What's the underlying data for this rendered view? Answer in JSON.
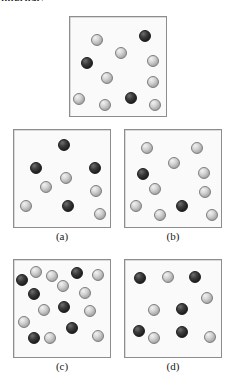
{
  "document": {
    "clipped_heading": "internal?",
    "background_color": "#ffffff"
  },
  "legend": {
    "light_sphere_color": "#c9c9c9",
    "dark_sphere_color": "#2b2b2b",
    "panel_fill_color": "#fafafa",
    "panel_border_color": "#8d8d8d"
  },
  "panels": [
    {
      "id": "reference",
      "label": "",
      "box": {
        "x": 69,
        "y": 16,
        "w": 98,
        "h": 101
      },
      "counts": {
        "light": 9,
        "dark": 3,
        "total": 12
      },
      "spheres": [
        {
          "x": 21,
          "y": 17,
          "type": "light"
        },
        {
          "x": 69,
          "y": 13,
          "type": "dark"
        },
        {
          "x": 45,
          "y": 30,
          "type": "light"
        },
        {
          "x": 11,
          "y": 40,
          "type": "dark"
        },
        {
          "x": 77,
          "y": 38,
          "type": "light"
        },
        {
          "x": 31,
          "y": 55,
          "type": "light"
        },
        {
          "x": 77,
          "y": 59,
          "type": "light"
        },
        {
          "x": 3,
          "y": 76,
          "type": "light"
        },
        {
          "x": 55,
          "y": 75,
          "type": "dark"
        },
        {
          "x": 29,
          "y": 82,
          "type": "light"
        },
        {
          "x": 79,
          "y": 82,
          "type": "light"
        }
      ]
    },
    {
      "id": "a",
      "label": "(a)",
      "box": {
        "x": 13,
        "y": 129,
        "w": 98,
        "h": 99
      },
      "counts": {
        "light": 6,
        "dark": 4,
        "total": 10
      },
      "spheres": [
        {
          "x": 44,
          "y": 9,
          "type": "dark"
        },
        {
          "x": 16,
          "y": 32,
          "type": "dark"
        },
        {
          "x": 75,
          "y": 32,
          "type": "dark"
        },
        {
          "x": 46,
          "y": 42,
          "type": "light"
        },
        {
          "x": 26,
          "y": 51,
          "type": "light"
        },
        {
          "x": 76,
          "y": 55,
          "type": "light"
        },
        {
          "x": 6,
          "y": 70,
          "type": "light"
        },
        {
          "x": 48,
          "y": 70,
          "type": "dark"
        },
        {
          "x": 80,
          "y": 78,
          "type": "light"
        }
      ]
    },
    {
      "id": "b",
      "label": "(b)",
      "box": {
        "x": 124,
        "y": 129,
        "w": 98,
        "h": 99
      },
      "counts": {
        "light": 9,
        "dark": 2,
        "total": 11
      },
      "spheres": [
        {
          "x": 16,
          "y": 12,
          "type": "light"
        },
        {
          "x": 66,
          "y": 12,
          "type": "light"
        },
        {
          "x": 43,
          "y": 27,
          "type": "light"
        },
        {
          "x": 12,
          "y": 38,
          "type": "dark"
        },
        {
          "x": 73,
          "y": 37,
          "type": "light"
        },
        {
          "x": 24,
          "y": 53,
          "type": "light"
        },
        {
          "x": 74,
          "y": 56,
          "type": "light"
        },
        {
          "x": 5,
          "y": 70,
          "type": "light"
        },
        {
          "x": 51,
          "y": 70,
          "type": "dark"
        },
        {
          "x": 29,
          "y": 79,
          "type": "light"
        },
        {
          "x": 81,
          "y": 79,
          "type": "light"
        }
      ]
    },
    {
      "id": "c",
      "label": "(c)",
      "box": {
        "x": 13,
        "y": 259,
        "w": 98,
        "h": 99
      },
      "counts": {
        "light": 10,
        "dark": 8,
        "total": 18
      },
      "spheres": [
        {
          "x": 16,
          "y": 6,
          "type": "light"
        },
        {
          "x": 32,
          "y": 10,
          "type": "light"
        },
        {
          "x": 57,
          "y": 7,
          "type": "dark"
        },
        {
          "x": 78,
          "y": 9,
          "type": "light"
        },
        {
          "x": 2,
          "y": 14,
          "type": "dark"
        },
        {
          "x": 43,
          "y": 20,
          "type": "light"
        },
        {
          "x": 14,
          "y": 28,
          "type": "dark"
        },
        {
          "x": 65,
          "y": 27,
          "type": "light"
        },
        {
          "x": 44,
          "y": 41,
          "type": "dark"
        },
        {
          "x": 24,
          "y": 44,
          "type": "light"
        },
        {
          "x": 70,
          "y": 45,
          "type": "light"
        },
        {
          "x": 4,
          "y": 56,
          "type": "light"
        },
        {
          "x": 52,
          "y": 62,
          "type": "dark"
        },
        {
          "x": 14,
          "y": 72,
          "type": "dark"
        },
        {
          "x": 30,
          "y": 72,
          "type": "light"
        },
        {
          "x": 78,
          "y": 70,
          "type": "light"
        }
      ]
    },
    {
      "id": "d",
      "label": "(d)",
      "box": {
        "x": 124,
        "y": 259,
        "w": 98,
        "h": 99
      },
      "counts": {
        "light": 5,
        "dark": 5,
        "total": 10
      },
      "spheres": [
        {
          "x": 9,
          "y": 12,
          "type": "dark"
        },
        {
          "x": 37,
          "y": 11,
          "type": "light"
        },
        {
          "x": 64,
          "y": 11,
          "type": "dark"
        },
        {
          "x": 76,
          "y": 32,
          "type": "light"
        },
        {
          "x": 23,
          "y": 44,
          "type": "light"
        },
        {
          "x": 51,
          "y": 43,
          "type": "dark"
        },
        {
          "x": 8,
          "y": 65,
          "type": "dark"
        },
        {
          "x": 51,
          "y": 66,
          "type": "dark"
        },
        {
          "x": 23,
          "y": 72,
          "type": "light"
        },
        {
          "x": 79,
          "y": 71,
          "type": "light"
        }
      ]
    }
  ],
  "sphere_size": 12
}
